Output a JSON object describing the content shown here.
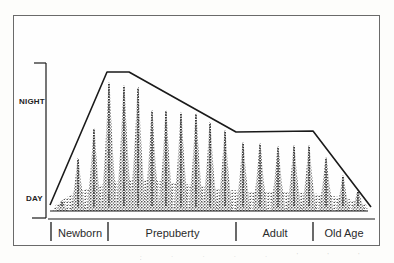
{
  "diagram": {
    "type": "sleep-pattern-across-lifespan",
    "y_axis": {
      "top_label": "NIGHT",
      "bottom_label": "DAY"
    },
    "stages": [
      {
        "label": "Newborn"
      },
      {
        "label": "Prepuberty"
      },
      {
        "label": "Adult"
      },
      {
        "label": "Old Age"
      }
    ],
    "envelope_points": [
      [
        50,
        205
      ],
      [
        107,
        72
      ],
      [
        129,
        72
      ],
      [
        236,
        132
      ],
      [
        313,
        131
      ],
      [
        371,
        207
      ]
    ],
    "spikes": [
      {
        "x": 62,
        "peak": 200,
        "w": 9
      },
      {
        "x": 78,
        "peak": 158,
        "w": 11
      },
      {
        "x": 94,
        "peak": 128,
        "w": 11
      },
      {
        "x": 109,
        "peak": 82,
        "w": 12
      },
      {
        "x": 124,
        "peak": 85,
        "w": 12
      },
      {
        "x": 138,
        "peak": 87,
        "w": 12
      },
      {
        "x": 152,
        "peak": 110,
        "w": 11
      },
      {
        "x": 166,
        "peak": 110,
        "w": 11
      },
      {
        "x": 181,
        "peak": 112,
        "w": 11
      },
      {
        "x": 196,
        "peak": 113,
        "w": 11
      },
      {
        "x": 210,
        "peak": 122,
        "w": 11
      },
      {
        "x": 225,
        "peak": 130,
        "w": 11
      },
      {
        "x": 243,
        "peak": 142,
        "w": 11
      },
      {
        "x": 260,
        "peak": 143,
        "w": 11
      },
      {
        "x": 278,
        "peak": 146,
        "w": 11
      },
      {
        "x": 294,
        "peak": 145,
        "w": 11
      },
      {
        "x": 309,
        "peak": 145,
        "w": 11
      },
      {
        "x": 326,
        "peak": 157,
        "w": 11
      },
      {
        "x": 343,
        "peak": 175,
        "w": 10
      },
      {
        "x": 358,
        "peak": 190,
        "w": 10
      }
    ],
    "colors": {
      "ink": "#1a1a1a",
      "stipple": "#2b2b2b",
      "frame": "#6a6a6a",
      "background": "#fefefe"
    },
    "bottom_fragments": ". . . . . ' ' ' ' . . ."
  }
}
